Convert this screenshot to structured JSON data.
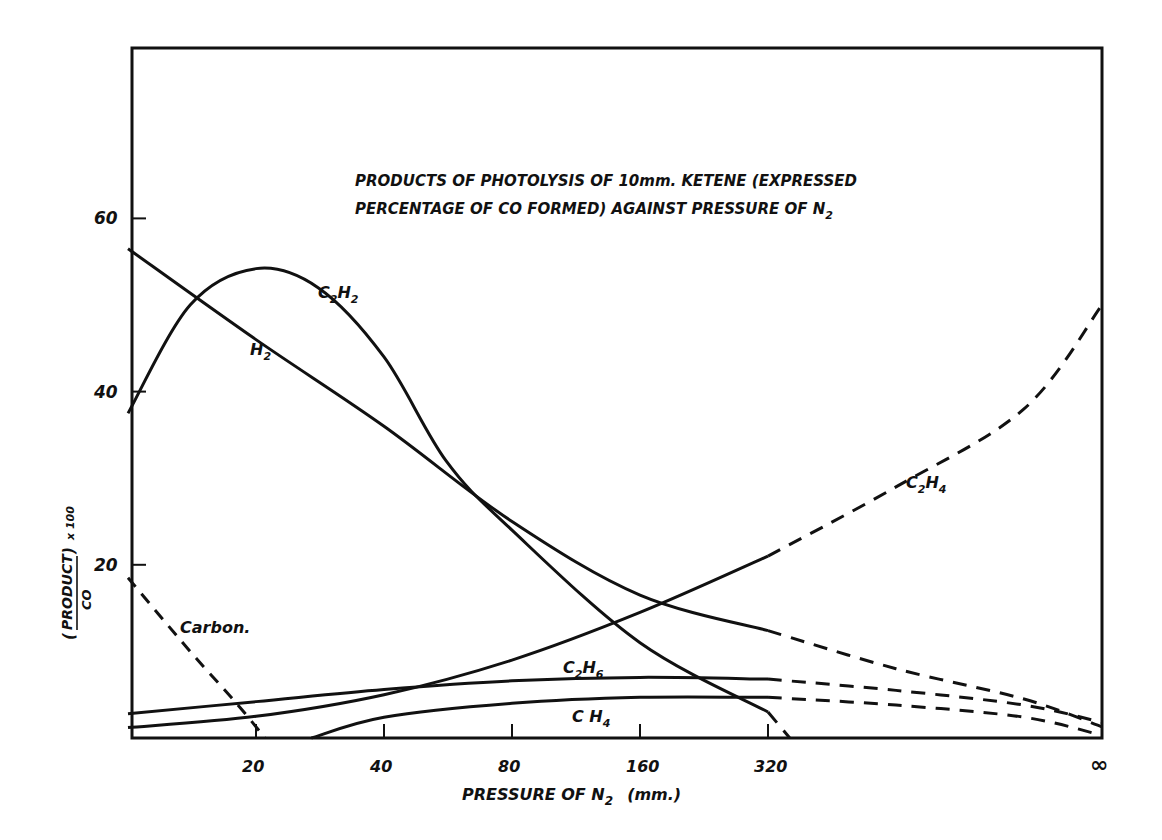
{
  "chart_data": {
    "type": "line",
    "title": "PRODUCTS OF PHOTOLYSIS OF 10mm. KETENE (EXPRESSED PERCENTAGE OF CO FORMED) AGAINST PRESSURE OF N2",
    "title_lines": [
      "PRODUCTS  OF  PHOTOLYSIS  OF  10mm.  KETENE  (EXPRESSED",
      "PERCENTAGE  OF CO  FORMED)   AGAINST  PRESSURE  OF  N"
    ],
    "title_subscript": "2",
    "xlabel": "PRESSURE  OF  N",
    "xlabel_subscript": "2",
    "xlabel_suffix": "(mm.)",
    "ylabel": "(PRODUCT)/(CO) x 100",
    "ylabel_num": "PRODUCT",
    "ylabel_den": "CO",
    "ylabel_factor": "x 100",
    "x_scale": "log2 (with ∞ at right edge)",
    "x_ticks": [
      "20",
      "40",
      "80",
      "160",
      "320",
      "∞"
    ],
    "x_tick_values": [
      20,
      40,
      80,
      160,
      320,
      "inf"
    ],
    "y_ticks": [
      "20",
      "40",
      "60"
    ],
    "y_tick_values": [
      20,
      40,
      60
    ],
    "ylim": [
      0,
      80
    ],
    "xlim": [
      10,
      "inf"
    ],
    "grid": false,
    "legend": "inline curve labels",
    "series": [
      {
        "name": "H2",
        "label": "H",
        "sub": "2",
        "style": "solid",
        "points": [
          [
            10,
            56.5
          ],
          [
            20,
            46
          ],
          [
            40,
            36
          ],
          [
            80,
            25
          ],
          [
            160,
            16.5
          ],
          [
            320,
            12.4
          ]
        ],
        "extrapolated": [
          [
            320,
            12.4
          ],
          [
            640,
            8
          ],
          [
            1280,
            4.5
          ],
          [
            "inf",
            1.3
          ]
        ]
      },
      {
        "name": "C2H2",
        "label": "C",
        "sub": "2",
        "label2": "H",
        "sub2": "2",
        "style": "solid",
        "points": [
          [
            10,
            37.5
          ],
          [
            14,
            50
          ],
          [
            20,
            54.2
          ],
          [
            28,
            52
          ],
          [
            40,
            44
          ],
          [
            56,
            32
          ],
          [
            80,
            24
          ],
          [
            160,
            11
          ],
          [
            320,
            3
          ]
        ],
        "extrapolated": [
          [
            320,
            3
          ],
          [
            360,
            0
          ]
        ]
      },
      {
        "name": "C2H4",
        "label": "C",
        "sub": "2",
        "label2": "H",
        "sub2": "4",
        "style": "solid",
        "points": [
          [
            10,
            1.2
          ],
          [
            20,
            2.5
          ],
          [
            40,
            5
          ],
          [
            80,
            9
          ],
          [
            160,
            14.5
          ],
          [
            320,
            21
          ]
        ],
        "extrapolated": [
          [
            320,
            21
          ],
          [
            640,
            29
          ],
          [
            1280,
            38
          ],
          [
            "inf",
            50
          ]
        ]
      },
      {
        "name": "C2H6",
        "label": "C",
        "sub": "2",
        "label2": "H",
        "sub2": "6",
        "style": "solid",
        "points": [
          [
            10,
            2.8
          ],
          [
            20,
            4.2
          ],
          [
            40,
            5.6
          ],
          [
            80,
            6.6
          ],
          [
            160,
            7.0
          ],
          [
            320,
            6.8
          ]
        ],
        "extrapolated": [
          [
            320,
            6.8
          ],
          [
            640,
            5.5
          ],
          [
            1280,
            3.8
          ],
          [
            "inf",
            1.8
          ]
        ]
      },
      {
        "name": "CH4",
        "label": "C H",
        "sub": "4",
        "style": "solid",
        "points": [
          [
            27,
            0
          ],
          [
            40,
            2.4
          ],
          [
            80,
            4.0
          ],
          [
            160,
            4.7
          ],
          [
            320,
            4.7
          ]
        ],
        "extrapolated": [
          [
            320,
            4.7
          ],
          [
            640,
            3.8
          ],
          [
            1280,
            2.4
          ],
          [
            "inf",
            0.3
          ]
        ]
      },
      {
        "name": "Carbon",
        "label": "Carbon.",
        "style": "dashed",
        "points": [
          [
            10,
            18.5
          ],
          [
            14,
            10
          ],
          [
            18,
            4
          ],
          [
            21,
            0
          ]
        ]
      }
    ]
  }
}
